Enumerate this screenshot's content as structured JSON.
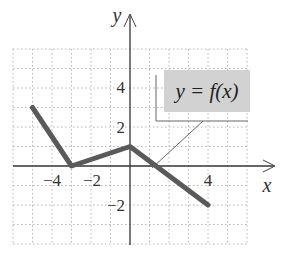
{
  "chart_data": {
    "type": "line",
    "title": "",
    "xlabel": "x",
    "ylabel": "y",
    "xlim": [
      -6,
      6
    ],
    "ylim": [
      -4,
      6
    ],
    "grid": true,
    "x_ticks": [
      {
        "value": -4,
        "label": "−4"
      },
      {
        "value": -2,
        "label": "−2"
      },
      {
        "value": 4,
        "label": "4"
      }
    ],
    "y_ticks": [
      {
        "value": 4,
        "label": "4"
      },
      {
        "value": 2,
        "label": "2"
      },
      {
        "value": -2,
        "label": "−2"
      }
    ],
    "series": [
      {
        "name": "y = f(x)",
        "x": [
          -5,
          -3,
          0,
          4
        ],
        "y": [
          3,
          0,
          1,
          -2
        ]
      }
    ],
    "annotations": [
      {
        "text": "y = f(x)",
        "points_to": [
          1.2,
          0
        ]
      }
    ],
    "colors": {
      "line": "#5a5a5a",
      "label_box": "#d2d2d2",
      "grid": "#b5b5b5",
      "axis": "#333333"
    }
  },
  "labels": {
    "x_axis": "x",
    "y_axis": "y",
    "function_label": "y = f(x)",
    "ticks": {
      "xm4": "−4",
      "xm2": "−2",
      "x4": "4",
      "y4": "4",
      "y2": "2",
      "ym2": "−2"
    }
  }
}
